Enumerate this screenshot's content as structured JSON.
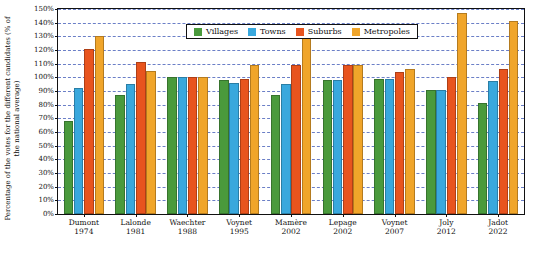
{
  "chart_data": {
    "type": "bar",
    "title": "",
    "xlabel": "",
    "ylabel": "Percentage of the votes for the different candidates\n(% of the national average)",
    "ylim": [
      0,
      150
    ],
    "ytick_labels": [
      "0%",
      "10%",
      "20%",
      "30%",
      "40%",
      "50%",
      "60%",
      "70%",
      "80%",
      "90%",
      "100%",
      "110%",
      "120%",
      "130%",
      "140%",
      "150%"
    ],
    "ytick_values": [
      0,
      10,
      20,
      30,
      40,
      50,
      60,
      70,
      80,
      90,
      100,
      110,
      120,
      130,
      140,
      150
    ],
    "grid": true,
    "legend_position": "top-center",
    "categories": [
      "Dumont\n1974",
      "Lalonde\n1981",
      "Waechter\n1988",
      "Voynet\n1995",
      "Mamère\n2002",
      "Lepage\n2002",
      "Voynet\n2007",
      "Joly\n2012",
      "Jadot\n2022"
    ],
    "series": [
      {
        "name": "Villages",
        "color": "#4a9a3c",
        "values": [
          68,
          87,
          100,
          98,
          87,
          98,
          99,
          91,
          81
        ]
      },
      {
        "name": "Towns",
        "color": "#39a8dd",
        "values": [
          92,
          95,
          100,
          96,
          95,
          98,
          99,
          91,
          97
        ]
      },
      {
        "name": "Suburbs",
        "color": "#e8541e",
        "values": [
          121,
          111,
          100,
          99,
          109,
          109,
          104,
          100,
          106
        ]
      },
      {
        "name": "Metropoles",
        "color": "#f0a52a",
        "values": [
          130,
          105,
          100,
          109,
          129,
          109,
          106,
          147,
          141
        ]
      }
    ]
  }
}
